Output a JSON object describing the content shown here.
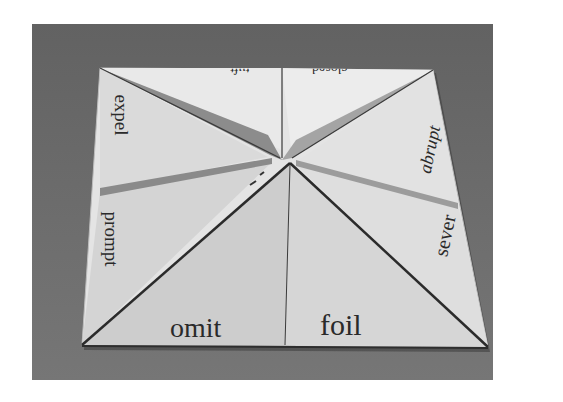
{
  "image": {
    "description": "Photograph of a paper fortune teller (cootie catcher) lying open on a gray surface, with words printed on the flaps",
    "colors": {
      "surface": "#6a6a6a",
      "paper_light": "#e6e6e6",
      "paper_mid": "#cfcfcf",
      "paper_shadow": "#9a9a9a",
      "fold_line": "#2b2b2b",
      "text": "#2a2a2a"
    }
  },
  "fortune_teller": {
    "words": {
      "top_left": "tuft",
      "top_right": "closed",
      "left_upper": "expel",
      "left_lower": "prompt",
      "right_upper": "abrupt",
      "right_lower": "sever",
      "bottom_left": "omit",
      "bottom_right": "foil"
    }
  }
}
